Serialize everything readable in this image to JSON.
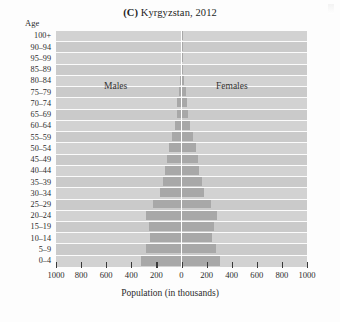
{
  "figure": {
    "title_label": "(C)",
    "title_text": "Kyrgyzstan, 2012",
    "age_caption": "Age",
    "xaxis_title": "Population (in thousands)"
  },
  "chart_data": {
    "type": "bar",
    "subtype": "population-pyramid",
    "title": "(C) Kyrgyzstan, 2012",
    "xlabel": "Population (in thousands)",
    "ylabel": "Age",
    "xlim": [
      -1000,
      1000
    ],
    "xticks": [
      1000,
      800,
      600,
      400,
      200,
      0,
      200,
      400,
      600,
      800,
      1000
    ],
    "xtick_labels": [
      "1000",
      "800",
      "600",
      "400",
      "200",
      "0",
      "200",
      "400",
      "600",
      "800",
      "1000"
    ],
    "grid": false,
    "legend_position": "inside-plot",
    "categories": [
      "100+",
      "90–94",
      "95–99",
      "85–89",
      "80–84",
      "75–79",
      "70–74",
      "65–69",
      "60–64",
      "55–59",
      "50–54",
      "45–49",
      "40–44",
      "35–39",
      "30–34",
      "25–29",
      "20–24",
      "15–19",
      "10–14",
      "5–9",
      "0–4"
    ],
    "series": [
      {
        "name": "Males",
        "side": "left",
        "values": [
          2,
          3,
          3,
          8,
          14,
          22,
          32,
          36,
          55,
          75,
          97,
          115,
          130,
          148,
          172,
          230,
          285,
          263,
          250,
          285,
          320
        ]
      },
      {
        "name": "Females",
        "side": "right",
        "values": [
          3,
          4,
          5,
          12,
          22,
          34,
          46,
          48,
          70,
          92,
          115,
          130,
          143,
          160,
          182,
          238,
          280,
          255,
          242,
          275,
          305
        ]
      }
    ],
    "annotations": [
      {
        "text": "Males",
        "position": "left-upper"
      },
      {
        "text": "Females",
        "position": "right-upper"
      }
    ]
  },
  "colors": {
    "bar": "#a8a8a8",
    "band_light": "#d2d2d2",
    "band_dark": "#cacaca",
    "axis_line": "#ffffff",
    "text": "#2b2b2b"
  }
}
